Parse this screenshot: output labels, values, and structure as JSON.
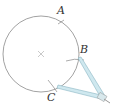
{
  "diagram": {
    "center_mark": "×",
    "points": [
      {
        "label": "A",
        "x": 63,
        "y": 11
      },
      {
        "label": "B",
        "x": 82,
        "y": 51
      },
      {
        "label": "C",
        "x": 51,
        "y": 98
      }
    ],
    "colors": {
      "circle": "#777777",
      "compass": "#9fd0e0",
      "compass_edge": "#7aaab8",
      "text": "#333333"
    }
  }
}
